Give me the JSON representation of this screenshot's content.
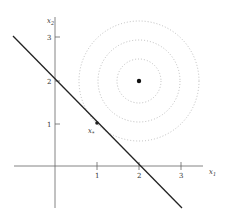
{
  "diagram": {
    "axes": {
      "x_label": "x",
      "x_label_sub": "1",
      "y_label": "x",
      "y_label_sub": "2",
      "x_ticks": [
        "1",
        "2",
        "3"
      ],
      "y_ticks": [
        "1",
        "2",
        "3"
      ]
    },
    "line": {
      "equation": "x1 + x2 = 2"
    },
    "center_point": {
      "x": 2,
      "y": 2
    },
    "contours": {
      "count": 3,
      "radii": [
        1,
        1.5,
        2
      ],
      "style": "dotted"
    },
    "solution_point": {
      "label": "x",
      "label_sub": "*",
      "x": 1,
      "y": 1
    }
  }
}
